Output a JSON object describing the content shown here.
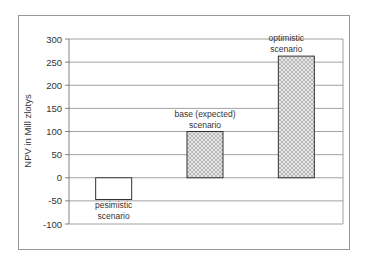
{
  "chart_data": {
    "type": "bar",
    "title": "",
    "xlabel": "",
    "ylabel": "NPV in Mill zlotys",
    "ylim": [
      -100,
      300
    ],
    "yticks": [
      300,
      250,
      200,
      150,
      100,
      50,
      0,
      -50,
      -100
    ],
    "grid": true,
    "legend": null,
    "categories": [
      "pesimistic scenario",
      "base (expected) scenario",
      "optimistic scenario"
    ],
    "values": [
      -47,
      100,
      263
    ],
    "annotations": [
      {
        "lines": [
          "pesimistic",
          "scenario"
        ]
      },
      {
        "lines": [
          "base (expected)",
          "scenario"
        ]
      },
      {
        "lines": [
          "optimistic",
          "scenario"
        ]
      }
    ]
  }
}
